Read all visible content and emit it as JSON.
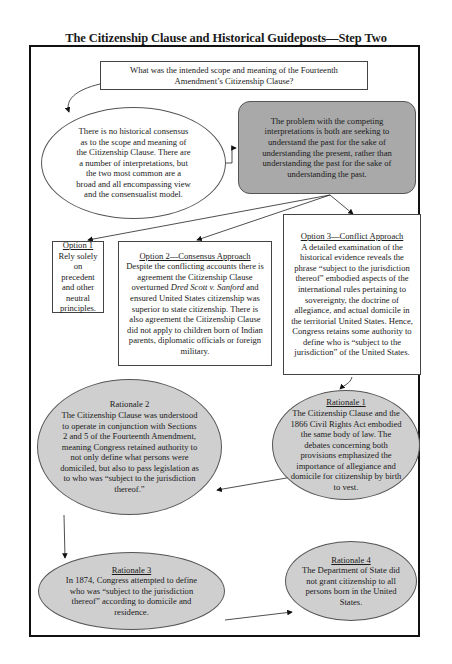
{
  "title": "The Citizenship Clause and Historical Guideposts—Step Two",
  "question": {
    "text": "What was the intended scope and meaning of the Fourteenth Amendment’s Citizenship Clause?"
  },
  "no_consensus": {
    "text": "There is no historical consensus as to the scope and meaning of the Citizenship Clause.  There are a number of interpretations, but the two most common are a broad and all encompassing view and the consensualist model."
  },
  "problem": {
    "text": "The problem with the competing interpretations is both are seeking to understand the past for the sake of understanding the present, rather than understanding the past for the sake of understanding the past."
  },
  "options": [
    {
      "heading": "Option 1",
      "text": "Rely solely on precedent and other neutral principles."
    },
    {
      "heading": "Option 2—Consensus Approach",
      "text_before": "Despite the conflicting accounts there is agreement the Citizenship Clause overturned ",
      "case_name": "Dred Scott v. Sanford",
      "text_after": " and ensured United States citizenship was superior to state citizenship.  There is also agreement the Citizenship Clause did not apply to children born of Indian parents, diplomatic officials or foreign military."
    },
    {
      "heading": "Option 3—Conflict Approach",
      "text": "A detailed examination of the historical evidence reveals the phrase “subject to the jurisdiction thereof” embodied aspects of the international rules pertaining to sovereignty, the doctrine of allegiance, and actual domicile in the territorial United States. Hence, Congress retains some authority to define who is “subject to the jurisdiction” of the United States."
    }
  ],
  "rationales": [
    {
      "heading": "Rationale 1",
      "text": "The Citizenship Clause and the 1866 Civil Rights Act embodied the same body of law.  The debates concerning both provisions emphasized the importance of allegiance and domicile for citizenship by birth to vest."
    },
    {
      "heading": "Rationale 2",
      "text": "The Citizenship Clause was understood to operate in conjunction with Sections 2 and 5 of the Fourteenth Amendment, meaning Congress retained authority to not only define what persons were domiciled, but also to pass legislation as to who was “subject to the jurisdiction thereof.”"
    },
    {
      "heading": "Rationale 3",
      "text": "In 1874, Congress attempted to define who was “subject to the jurisdiction thereof” according to domicile and residence."
    },
    {
      "heading": "Rationale 4",
      "text": "The Department of State did not grant citizenship to all persons born in the United States."
    }
  ],
  "colors": {
    "gray_box": "#a9a9a9",
    "gray_ellipse": "#cfcfcf",
    "border": "#111111"
  }
}
